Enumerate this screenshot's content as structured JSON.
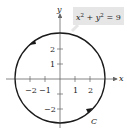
{
  "diagram": {
    "equation": {
      "base_x": "x",
      "exp_x": "2",
      "plus": " + ",
      "base_y": "y",
      "exp_y": "2",
      "rest": " = 9"
    },
    "axes": {
      "x_label": "x",
      "y_label": "y"
    },
    "x_ticks": [
      "−2",
      "−1",
      "1",
      "2"
    ],
    "y_ticks": [
      "2",
      "1",
      "−2"
    ],
    "curve_label": "C",
    "orientation": "counterclockwise",
    "radius": 3,
    "colors": {
      "curve": "#1a1a1a",
      "axis": "#555555",
      "label_box": "#e6e6e6"
    }
  }
}
